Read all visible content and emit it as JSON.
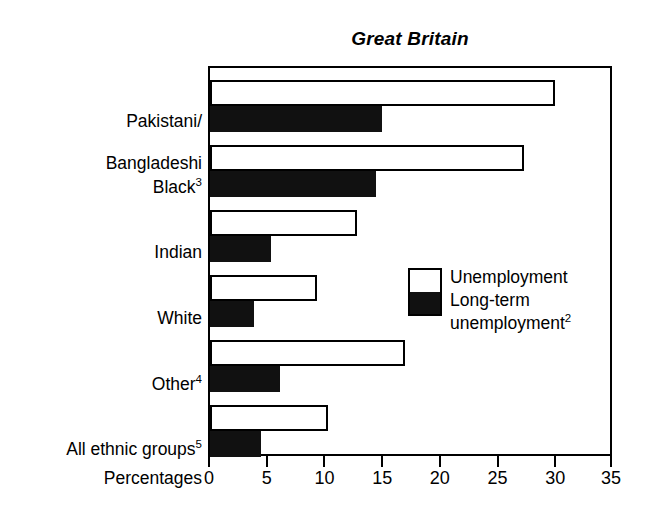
{
  "chart_data": {
    "type": "bar",
    "orientation": "horizontal",
    "title": "Great Britain",
    "xlabel": "Percentages",
    "ylabel": "",
    "xlim": [
      0,
      35
    ],
    "xticks": [
      0,
      5,
      10,
      15,
      20,
      25,
      30,
      35
    ],
    "grid": false,
    "legend_position": "inside-right",
    "categories": [
      "Pakistani/\nBangladeshi",
      "Black",
      "Indian",
      "White",
      "Other",
      "All ethnic groups"
    ],
    "category_footnotes": [
      "",
      "3",
      "",
      "",
      "4",
      "5"
    ],
    "series": [
      {
        "name": "Unemployment",
        "footnote": "",
        "color": "#ffffff",
        "values": [
          29.9,
          27.2,
          12.7,
          9.3,
          16.9,
          10.2
        ]
      },
      {
        "name": "Long-term\nunemployment",
        "footnote": "2",
        "color": "#111111",
        "values": [
          14.9,
          14.4,
          5.3,
          3.8,
          6.1,
          4.4
        ]
      }
    ]
  },
  "legend": {
    "item_1": "Unemployment",
    "item_2_line1": "Long-term",
    "item_2_line2": "unemployment",
    "item_2_footnote": "2"
  },
  "axis": {
    "title": "Percentages",
    "ticks": [
      "0",
      "5",
      "10",
      "15",
      "20",
      "25",
      "30",
      "35"
    ]
  },
  "labels": {
    "cat_0_line1": "Pakistani/",
    "cat_0_line2": "Bangladeshi",
    "cat_1": "Black",
    "cat_1_sup": "3",
    "cat_2": "Indian",
    "cat_3": "White",
    "cat_4": "Other",
    "cat_4_sup": "4",
    "cat_5": "All ethnic groups",
    "cat_5_sup": "5"
  },
  "colors": {
    "ink": "#000000",
    "solid_bar": "#111111",
    "open_bar": "#ffffff",
    "background": "#ffffff"
  }
}
